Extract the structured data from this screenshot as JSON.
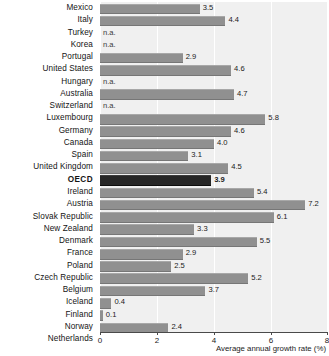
{
  "chart_data": {
    "type": "bar",
    "orientation": "horizontal",
    "title": "",
    "xlabel": "Average annual growth rate (%)",
    "ylabel": "",
    "xlim": [
      0,
      8
    ],
    "xticks": [
      0,
      2,
      4,
      6,
      8
    ],
    "xtick_labels": [
      "0",
      "2",
      "4",
      "6",
      "8"
    ],
    "grid": true,
    "grid_axis": "x",
    "legend": "none",
    "na_label": "n.a.",
    "highlight_category": "OECD",
    "categories": [
      "Mexico",
      "Italy",
      "Turkey",
      "Korea",
      "Portugal",
      "United States",
      "Hungary",
      "Australia",
      "Switzerland",
      "Luxembourg",
      "Germany",
      "Canada",
      "Spain",
      "United Kingdom",
      "OECD",
      "Ireland",
      "Austria",
      "Slovak Republic",
      "New Zealand",
      "Denmark",
      "France",
      "Poland",
      "Czech Republic",
      "Belgium",
      "Iceland",
      "Finland",
      "Norway",
      "Netherlands"
    ],
    "values": [
      3.5,
      4.4,
      null,
      null,
      2.9,
      4.6,
      null,
      4.7,
      null,
      5.8,
      4.6,
      4.0,
      3.1,
      4.5,
      3.9,
      5.4,
      7.2,
      6.1,
      3.3,
      5.5,
      2.9,
      2.5,
      5.2,
      3.7,
      0.4,
      0.1,
      2.4,
      3.0
    ],
    "value_labels": [
      "3.5",
      "4.4",
      "n.a.",
      "n.a.",
      "2.9",
      "4.6",
      "n.a.",
      "4.7",
      "n.a.",
      "5.8",
      "4.6",
      "4.0",
      "3.1",
      "4.5",
      "3.9",
      "5.4",
      "7.2",
      "6.1",
      "3.3",
      "5.5",
      "2.9",
      "2.5",
      "5.2",
      "3.7",
      "0.4",
      "0.1",
      "2.4",
      "3.0"
    ],
    "colors": {
      "bar": "#909090",
      "bar_highlight": "#262626",
      "plot_background": "#f0f0f0",
      "gridline": "#ffffff",
      "axis": "#4a4a4a",
      "text": "#1a1a1a"
    }
  }
}
